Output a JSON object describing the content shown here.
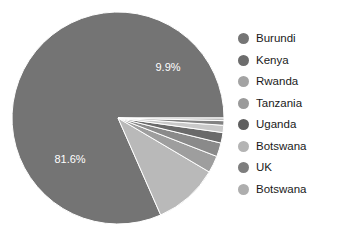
{
  "chart_data": {
    "type": "pie",
    "title": "",
    "legend_position": "right",
    "grid": false,
    "categories": [
      "Burundi",
      "Kenya",
      "Rwanda",
      "Tanzania",
      "Uganda",
      "Botswana",
      "UK",
      "Botswana"
    ],
    "values": [
      81.6,
      9.9,
      2.6,
      2.1,
      1.6,
      1.1,
      0.7,
      0.4
    ],
    "unit": "%",
    "visible_labels": [
      "81.6%",
      "9.9%"
    ],
    "slice_colors": [
      "#747474",
      "#b9b9b9",
      "#9e9e9e",
      "#8a8a8a",
      "#6a6a6a",
      "#c9c9c9",
      "#828282",
      "#bdbdbd"
    ],
    "legend_colors": [
      "#757575",
      "#6d6d6d",
      "#a3a3a3",
      "#9a9a9a",
      "#5f5f5f",
      "#b4b4b4",
      "#7e7e7e",
      "#aeaeae"
    ],
    "background": "#ffffff"
  },
  "labels": {
    "burundi_pct": "81.6%",
    "kenya_pct": "9.9%"
  },
  "legend": {
    "items": [
      {
        "label": "Burundi"
      },
      {
        "label": "Kenya"
      },
      {
        "label": "Rwanda"
      },
      {
        "label": "Tanzania"
      },
      {
        "label": "Uganda"
      },
      {
        "label": "Botswana"
      },
      {
        "label": "UK"
      },
      {
        "label": "Botswana"
      }
    ]
  }
}
